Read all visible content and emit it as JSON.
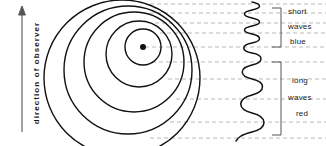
{
  "figure": {
    "axis": {
      "label": "direction of observer",
      "arrow_direction": "up"
    },
    "source": {
      "name": "moving-source-dot",
      "center_x": 143,
      "center_y": 47
    },
    "wavefronts": {
      "count": 5,
      "description": "concentric circles compressed toward top"
    },
    "wave_trace": {
      "name": "wavelength-trace",
      "top_wavelength": "short",
      "bottom_wavelength": "long"
    },
    "brackets": [
      {
        "id": "short-bracket",
        "lines": [
          "short",
          "waves",
          "blue"
        ]
      },
      {
        "id": "long-bracket",
        "lines": [
          "long",
          "waves",
          "red"
        ]
      }
    ],
    "labels": {
      "short_1": "short",
      "short_2": "waves",
      "short_3": "blue",
      "long_1": "long",
      "long_2": "waves",
      "long_3": "red"
    },
    "colors": {
      "ink": "#1a1a1a",
      "stroke": "#111111",
      "dashed_guide": "#b9b9b9",
      "background": "#ffffff"
    }
  }
}
